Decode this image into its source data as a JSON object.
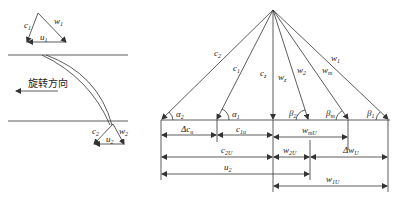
{
  "left_panel": {
    "inlet_triangle": {
      "labels": {
        "c": "c",
        "c_sub": "1",
        "w": "w",
        "w_sub": "1",
        "u": "u",
        "u_sub": "1"
      }
    },
    "outlet_triangle": {
      "labels": {
        "c": "c",
        "c_sub": "2",
        "w": "w",
        "w_sub": "2",
        "u": "u",
        "u_sub": "2"
      }
    },
    "rotation_label": "旋转方向"
  },
  "right_panel": {
    "vectors": [
      {
        "name": "c",
        "sub": "2"
      },
      {
        "name": "c",
        "sub": "1"
      },
      {
        "name": "c",
        "sub": "z"
      },
      {
        "name": "w",
        "sub": "z"
      },
      {
        "name": "w",
        "sub": "2"
      },
      {
        "name": "w",
        "sub": "m"
      },
      {
        "name": "w",
        "sub": "1"
      }
    ],
    "angles": [
      {
        "name": "α",
        "sub": "2"
      },
      {
        "name": "α",
        "sub": "1"
      },
      {
        "name": "β",
        "sub": "2"
      },
      {
        "name": "β",
        "sub": "m"
      },
      {
        "name": "β",
        "sub": "1"
      }
    ],
    "dimensions": {
      "delta_cu": {
        "name": "Δc",
        "sub": "u"
      },
      "c1u": {
        "name": "c",
        "sub": "1u"
      },
      "wmu": {
        "name": "w",
        "sub": "mU"
      },
      "c2u": {
        "name": "c",
        "sub": "2U"
      },
      "w2u": {
        "name": "w",
        "sub": "2U"
      },
      "delta_wu": {
        "name": "Δw",
        "sub": "U"
      },
      "u2": {
        "name": "u",
        "sub": "2"
      },
      "w1u": {
        "name": "w",
        "sub": "1U"
      }
    }
  }
}
